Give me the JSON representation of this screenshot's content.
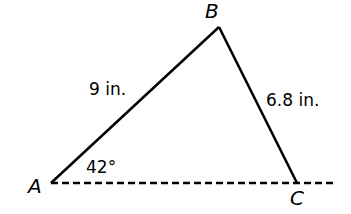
{
  "diagram": {
    "type": "triangle",
    "vertices": {
      "A": {
        "label": "A",
        "x": 51,
        "y": 183
      },
      "B": {
        "label": "B",
        "x": 219,
        "y": 27
      },
      "C": {
        "label": "C",
        "x": 297,
        "y": 183
      }
    },
    "side_AB": "9 in.",
    "side_BC": "6.8 in.",
    "angle_A": "42°",
    "baseline": "dashed line through A and C"
  }
}
